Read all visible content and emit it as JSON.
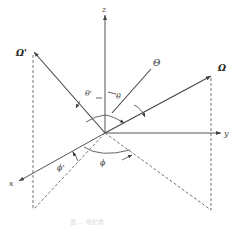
{
  "figure": {
    "type": "3d-scattering-angle-diagram",
    "caption": "图 ... 散射角",
    "origin": [
      105,
      133
    ],
    "axes": {
      "z": {
        "label": "z",
        "end": [
          105,
          15
        ]
      },
      "y": {
        "label": "y",
        "end": [
          222,
          133
        ]
      },
      "x": {
        "label": "x",
        "end": [
          20,
          181
        ]
      }
    },
    "vectors": {
      "omega": {
        "label": "Ω",
        "end": [
          212,
          75
        ]
      },
      "omega_prime": {
        "label": "Ω'",
        "end": [
          33,
          52
        ]
      }
    },
    "angles": {
      "theta": {
        "label": "θ"
      },
      "theta_prime": {
        "label": "θ'"
      },
      "big_theta": {
        "label": "Θ"
      },
      "phi": {
        "label": "ϕ"
      },
      "phi_prime": {
        "label": "ϕ'"
      }
    },
    "projections": {
      "omega_foot": [
        211,
        210
      ],
      "omega_prime_foot": [
        33,
        210
      ]
    }
  }
}
